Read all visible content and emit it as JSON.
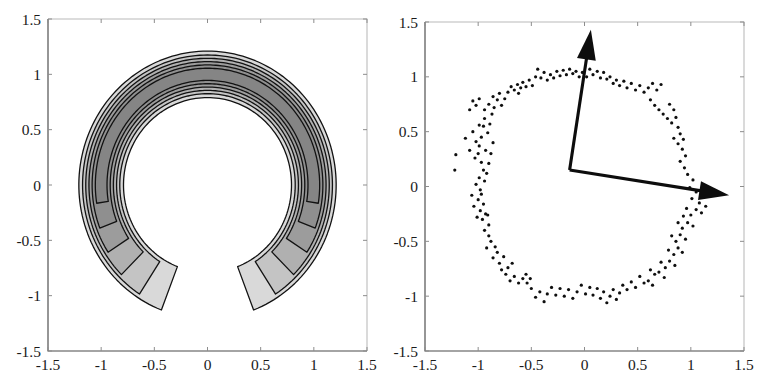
{
  "figure": {
    "background_color": "#ffffff",
    "panel_count": 2
  },
  "chart_data": [
    {
      "id": "left-panel",
      "type": "contour",
      "title": "",
      "xlabel": "",
      "ylabel": "",
      "xlim": [
        -1.5,
        1.5
      ],
      "ylim": [
        -1.5,
        1.5
      ],
      "grid": false,
      "legend": "none",
      "xticks": [
        -1.5,
        -1,
        -0.5,
        0,
        0.5,
        1,
        1.5
      ],
      "xticklabels": [
        "-1.5",
        "-1",
        "-0.5",
        "0",
        "0.5",
        "1",
        "1.5"
      ],
      "yticks": [
        -1.5,
        -1,
        -0.5,
        0,
        0.5,
        1,
        1.5
      ],
      "yticklabels": [
        "-1.5",
        "-1",
        "-0.5",
        "0",
        "0.5",
        "1",
        "1.5"
      ],
      "description": "Filled grayscale contour map of a crescent / horseshoe shaped density opening downward, centered near the origin with radius about 1, contour bands between radius 0.8 and 1.2",
      "contour_levels": [
        1,
        2,
        3,
        4,
        5,
        6
      ],
      "fill_colors": [
        "#d9d9d9",
        "#c4c4c4",
        "#b0b0b0",
        "#9c9c9c",
        "#8f8f8f",
        "#858585"
      ],
      "line_color": "#121212",
      "center": [
        0.0,
        0.0
      ],
      "radial_band": {
        "r_outer": 1.21,
        "r_inner": 0.79,
        "angle_open_start_deg": 249,
        "angle_open_end_deg": 291
      },
      "rings": [
        {
          "level": 1,
          "r_outer": 1.21,
          "r_inner": 0.79,
          "gap_half_angle_deg": 21,
          "fill": "#d9d9d9"
        },
        {
          "level": 2,
          "r_outer": 1.175,
          "r_inner": 0.825,
          "gap_half_angle_deg": 33,
          "fill": "#c4c4c4"
        },
        {
          "level": 3,
          "r_outer": 1.145,
          "r_inner": 0.855,
          "gap_half_angle_deg": 45,
          "fill": "#b0b0b0"
        },
        {
          "level": 4,
          "r_outer": 1.115,
          "r_inner": 0.885,
          "gap_half_angle_deg": 57,
          "fill": "#9c9c9c"
        },
        {
          "level": 5,
          "r_outer": 1.085,
          "r_inner": 0.915,
          "gap_half_angle_deg": 69,
          "fill": "#8f8f8f"
        },
        {
          "level": 6,
          "r_outer": 1.055,
          "r_inner": 0.945,
          "gap_half_angle_deg": 81,
          "fill": "#858585"
        }
      ]
    },
    {
      "id": "right-panel",
      "type": "scatter",
      "title": "",
      "xlabel": "",
      "ylabel": "",
      "xlim": [
        -1.5,
        1.5
      ],
      "ylim": [
        -1.5,
        1.5
      ],
      "grid": false,
      "legend": "none",
      "xticks": [
        -1.5,
        -1,
        -0.5,
        0,
        0.5,
        1,
        1.5
      ],
      "xticklabels": [
        "-1.5",
        "-1",
        "-0.5",
        "0",
        "0.5",
        "1",
        "1.5"
      ],
      "yticks": [
        -1.5,
        -1,
        -0.5,
        0,
        0.5,
        1,
        1.5
      ],
      "yticklabels": [
        "-1.5",
        "-1",
        "-0.5",
        "0",
        "0.5",
        "1",
        "1.5"
      ],
      "description": "Scatter of noisy samples distributed around a unit circle, with two black arrows drawn from a common origin",
      "marker": {
        "shape": "circle",
        "size_px": 3.2,
        "color": "#0f0f0f"
      },
      "point_count": 200,
      "points": [
        [
          -1.21,
          0.29
        ],
        [
          -1.22,
          0.15
        ],
        [
          -1.12,
          0.44
        ],
        [
          -1.08,
          0.33
        ],
        [
          -1.05,
          0.5
        ],
        [
          -1.02,
          0.41
        ],
        [
          -1.0,
          0.3
        ],
        [
          -0.99,
          0.37
        ],
        [
          -1.03,
          0.26
        ],
        [
          -0.97,
          0.45
        ],
        [
          -0.95,
          0.55
        ],
        [
          -0.94,
          0.62
        ],
        [
          -0.99,
          0.56
        ],
        [
          -0.91,
          0.49
        ],
        [
          -0.93,
          0.33
        ],
        [
          -0.97,
          0.22
        ],
        [
          -0.95,
          0.15
        ],
        [
          -0.99,
          0.08
        ],
        [
          -1.02,
          0.02
        ],
        [
          -0.98,
          -0.03
        ],
        [
          -0.94,
          0.05
        ],
        [
          -0.92,
          0.12
        ],
        [
          -0.9,
          0.21
        ],
        [
          -0.88,
          0.3
        ],
        [
          -0.86,
          0.4
        ],
        [
          -0.89,
          0.57
        ],
        [
          -0.87,
          0.66
        ],
        [
          -0.85,
          0.72
        ],
        [
          -0.9,
          0.75
        ],
        [
          -0.94,
          0.7
        ],
        [
          -0.82,
          0.79
        ],
        [
          -0.8,
          0.85
        ],
        [
          -0.86,
          0.82
        ],
        [
          -0.78,
          0.74
        ],
        [
          -0.75,
          0.8
        ],
        [
          -0.72,
          0.86
        ],
        [
          -0.69,
          0.91
        ],
        [
          -0.66,
          0.88
        ],
        [
          -0.63,
          0.93
        ],
        [
          -0.6,
          0.9
        ],
        [
          -1.05,
          0.78
        ],
        [
          -1.02,
          0.74
        ],
        [
          -0.99,
          0.8
        ],
        [
          -1.08,
          0.7
        ],
        [
          -0.62,
          0.85
        ],
        [
          -0.58,
          0.95
        ],
        [
          -0.55,
          0.91
        ],
        [
          -0.52,
          0.97
        ],
        [
          -0.49,
          0.92
        ],
        [
          -0.46,
          1.0
        ],
        [
          -0.44,
          1.07
        ],
        [
          -0.41,
          0.99
        ],
        [
          -0.38,
          1.04
        ],
        [
          -0.35,
          0.97
        ],
        [
          -0.32,
          1.02
        ],
        [
          -0.29,
          0.99
        ],
        [
          -0.26,
          1.05
        ],
        [
          -0.23,
          1.01
        ],
        [
          -0.2,
          1.06
        ],
        [
          -0.17,
          1.02
        ],
        [
          -0.14,
          1.07
        ],
        [
          -0.11,
          1.03
        ],
        [
          -0.08,
          1.05
        ],
        [
          -0.05,
          1.0
        ],
        [
          -0.02,
          1.04
        ],
        [
          0.02,
          1.0
        ],
        [
          0.05,
          1.07
        ],
        [
          0.08,
          1.02
        ],
        [
          0.12,
          1.05
        ],
        [
          0.15,
          0.99
        ],
        [
          0.18,
          1.04
        ],
        [
          0.21,
          0.98
        ],
        [
          0.24,
          1.0
        ],
        [
          0.27,
          0.94
        ],
        [
          0.3,
          0.97
        ],
        [
          0.33,
          0.92
        ],
        [
          0.37,
          0.96
        ],
        [
          0.4,
          0.9
        ],
        [
          0.44,
          0.94
        ],
        [
          0.48,
          0.88
        ],
        [
          0.52,
          0.92
        ],
        [
          0.56,
          0.86
        ],
        [
          0.6,
          0.9
        ],
        [
          0.64,
          0.94
        ],
        [
          0.68,
          0.88
        ],
        [
          0.72,
          0.93
        ],
        [
          0.62,
          0.79
        ],
        [
          0.66,
          0.74
        ],
        [
          0.7,
          0.7
        ],
        [
          0.74,
          0.66
        ],
        [
          0.78,
          0.62
        ],
        [
          0.82,
          0.58
        ],
        [
          0.86,
          0.63
        ],
        [
          0.84,
          0.7
        ],
        [
          0.8,
          0.75
        ],
        [
          0.88,
          0.54
        ],
        [
          0.9,
          0.48
        ],
        [
          0.93,
          0.43
        ],
        [
          0.88,
          0.39
        ],
        [
          0.84,
          0.44
        ],
        [
          0.92,
          0.34
        ],
        [
          0.95,
          0.28
        ],
        [
          0.9,
          0.23
        ],
        [
          0.94,
          0.17
        ],
        [
          0.97,
          0.11
        ],
        [
          1.02,
          0.06
        ],
        [
          0.99,
          -0.01
        ],
        [
          1.05,
          -0.05
        ],
        [
          1.01,
          -0.11
        ],
        [
          1.08,
          -0.15
        ],
        [
          1.12,
          -0.09
        ],
        [
          1.14,
          -0.18
        ],
        [
          1.1,
          -0.24
        ],
        [
          1.05,
          -0.21
        ],
        [
          1.0,
          -0.26
        ],
        [
          0.96,
          -0.2
        ],
        [
          0.93,
          -0.27
        ],
        [
          0.97,
          -0.33
        ],
        [
          1.02,
          -0.36
        ],
        [
          0.92,
          -0.38
        ],
        [
          0.88,
          -0.33
        ],
        [
          0.9,
          -0.44
        ],
        [
          0.95,
          -0.48
        ],
        [
          0.86,
          -0.5
        ],
        [
          0.82,
          -0.45
        ],
        [
          0.88,
          -0.56
        ],
        [
          0.92,
          -0.6
        ],
        [
          0.84,
          -0.62
        ],
        [
          0.79,
          -0.58
        ],
        [
          0.8,
          -0.68
        ],
        [
          0.85,
          -0.72
        ],
        [
          0.76,
          -0.74
        ],
        [
          0.72,
          -0.69
        ],
        [
          0.7,
          -0.78
        ],
        [
          0.75,
          -0.83
        ],
        [
          0.66,
          -0.8
        ],
        [
          0.62,
          -0.76
        ],
        [
          0.6,
          -0.86
        ],
        [
          0.64,
          -0.9
        ],
        [
          0.56,
          -0.88
        ],
        [
          0.52,
          -0.82
        ],
        [
          0.48,
          -0.92
        ],
        [
          0.44,
          -0.87
        ],
        [
          0.4,
          -0.94
        ],
        [
          0.36,
          -0.9
        ],
        [
          0.33,
          -0.97
        ],
        [
          0.3,
          -1.03
        ],
        [
          0.27,
          -0.94
        ],
        [
          0.24,
          -1.0
        ],
        [
          0.21,
          -1.06
        ],
        [
          0.18,
          -0.96
        ],
        [
          0.15,
          -1.02
        ],
        [
          0.12,
          -0.93
        ],
        [
          0.08,
          -0.99
        ],
        [
          0.05,
          -0.92
        ],
        [
          0.01,
          -0.98
        ],
        [
          -0.03,
          -0.9
        ],
        [
          -0.07,
          -0.96
        ],
        [
          -0.11,
          -1.02
        ],
        [
          -0.15,
          -0.94
        ],
        [
          -0.19,
          -1.0
        ],
        [
          -0.23,
          -0.93
        ],
        [
          -0.27,
          -0.99
        ],
        [
          -0.31,
          -0.92
        ],
        [
          -0.35,
          -0.98
        ],
        [
          -0.38,
          -1.05
        ],
        [
          -0.42,
          -0.96
        ],
        [
          -0.46,
          -1.01
        ],
        [
          -0.5,
          -0.93
        ],
        [
          -0.54,
          -0.88
        ],
        [
          -0.58,
          -0.84
        ],
        [
          -0.55,
          -0.8
        ],
        [
          -0.51,
          -0.84
        ],
        [
          -0.62,
          -0.88
        ],
        [
          -0.66,
          -0.82
        ],
        [
          -0.7,
          -0.86
        ],
        [
          -0.74,
          -0.8
        ],
        [
          -0.72,
          -0.74
        ],
        [
          -0.68,
          -0.7
        ],
        [
          -0.78,
          -0.76
        ],
        [
          -0.8,
          -0.7
        ],
        [
          -0.76,
          -0.64
        ],
        [
          -0.82,
          -0.6
        ],
        [
          -0.86,
          -0.65
        ],
        [
          -0.84,
          -0.55
        ],
        [
          -0.88,
          -0.5
        ],
        [
          -0.92,
          -0.56
        ],
        [
          -0.9,
          -0.45
        ],
        [
          -0.94,
          -0.4
        ],
        [
          -0.9,
          -0.35
        ],
        [
          -0.96,
          -0.3
        ],
        [
          -0.93,
          -0.25
        ],
        [
          -0.98,
          -0.22
        ],
        [
          -1.01,
          -0.28
        ],
        [
          -0.95,
          -0.16
        ],
        [
          -1.0,
          -0.12
        ],
        [
          -0.97,
          -0.07
        ],
        [
          -1.04,
          -0.18
        ],
        [
          -1.06,
          -0.08
        ],
        [
          -0.91,
          -0.26
        ]
      ],
      "vectors": [
        {
          "name": "principal-component-1",
          "origin": [
            -0.14,
            0.15
          ],
          "tip": [
            0.06,
            1.43
          ],
          "color": "#0d0d0d"
        },
        {
          "name": "principal-component-2",
          "origin": [
            -0.14,
            0.15
          ],
          "tip": [
            1.36,
            -0.08
          ],
          "color": "#0d0d0d"
        }
      ]
    }
  ]
}
